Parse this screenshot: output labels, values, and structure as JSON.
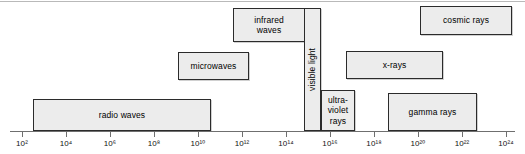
{
  "figure": {
    "background_color": "#ffffff",
    "box_fill_color": "#ececec",
    "box_border_color": "#2b2b2b",
    "axis_color": "#6f6f6f"
  },
  "chart_data": {
    "type": "bar",
    "xlabel": "",
    "ylabel": "",
    "orientation": "horizontal",
    "x_scale": "log10",
    "xlim": [
      2,
      24
    ],
    "grid": false,
    "legend": "none",
    "tick_labels": [
      "10²",
      "10⁴",
      "10⁶",
      "10⁸",
      "10¹⁰",
      "10¹²",
      "10¹⁴",
      "10¹⁶",
      "10¹⁸",
      "10²⁰",
      "10²²",
      "10²⁴"
    ],
    "tick_bases": [
      10,
      10,
      10,
      10,
      10,
      10,
      10,
      10,
      10,
      10,
      10,
      10
    ],
    "tick_exponents": [
      2,
      4,
      6,
      8,
      10,
      12,
      14,
      16,
      18,
      20,
      22,
      24
    ],
    "bands": [
      {
        "name": "radio-waves",
        "label": "radio waves",
        "x_start_exp": 2.5,
        "x_end_exp": 10.6,
        "row": "lower",
        "orientation": "horizontal"
      },
      {
        "name": "microwaves",
        "label": "microwaves",
        "x_start_exp": 9.1,
        "x_end_exp": 12.3,
        "row": "middle",
        "orientation": "horizontal"
      },
      {
        "name": "infrared-waves",
        "label": "infrared\nwaves",
        "x_start_exp": 11.6,
        "x_end_exp": 14.9,
        "row": "upper",
        "orientation": "horizontal"
      },
      {
        "name": "visible-light",
        "label": "visible light",
        "x_start_exp": 14.6,
        "x_end_exp": 15.3,
        "row": "full",
        "orientation": "vertical"
      },
      {
        "name": "ultraviolet-rays",
        "label": "ultra-\nviolet\nrays",
        "x_start_exp": 15.3,
        "x_end_exp": 16.9,
        "row": "lower",
        "orientation": "horizontal"
      },
      {
        "name": "x-rays",
        "label": "x-rays",
        "x_start_exp": 16.6,
        "x_end_exp": 21.0,
        "row": "middle",
        "orientation": "horizontal"
      },
      {
        "name": "gamma-rays",
        "label": "gamma rays",
        "x_start_exp": 18.5,
        "x_end_exp": 22.6,
        "row": "lower",
        "orientation": "horizontal"
      },
      {
        "name": "cosmic-rays",
        "label": "cosmic rays",
        "x_start_exp": 20.0,
        "x_end_exp": 24.2,
        "row": "upper",
        "orientation": "horizontal"
      }
    ]
  },
  "layout": {
    "bands_px": [
      {
        "key": "radio-waves",
        "left": 33,
        "top": 99,
        "width": 178,
        "height": 32,
        "vertical": false
      },
      {
        "key": "microwaves",
        "left": 178,
        "top": 52,
        "width": 71,
        "height": 28,
        "vertical": false
      },
      {
        "key": "infrared-waves",
        "left": 233,
        "top": 8,
        "width": 72,
        "height": 34,
        "vertical": false
      },
      {
        "key": "visible-light",
        "left": 304,
        "top": 8,
        "width": 17,
        "height": 123,
        "vertical": true
      },
      {
        "key": "ultraviolet-rays",
        "left": 321,
        "top": 90,
        "width": 34,
        "height": 41,
        "vertical": false
      },
      {
        "key": "x-rays",
        "left": 346,
        "top": 51,
        "width": 97,
        "height": 28,
        "vertical": false
      },
      {
        "key": "gamma-rays",
        "left": 388,
        "top": 93,
        "width": 89,
        "height": 38,
        "vertical": false
      },
      {
        "key": "cosmic-rays",
        "left": 420,
        "top": 6,
        "width": 92,
        "height": 29,
        "vertical": false
      }
    ],
    "axis_px": {
      "left": 10,
      "top": 131,
      "width": 505
    },
    "tick_x_px": [
      22,
      66,
      110,
      154,
      198,
      242,
      286,
      330,
      374,
      418,
      462,
      506
    ],
    "tick_top_px": 131,
    "tick_label_top_px": 139
  }
}
